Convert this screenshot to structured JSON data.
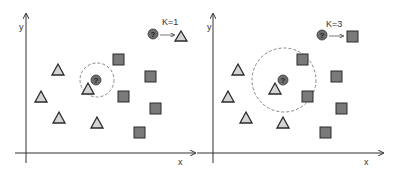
{
  "colors": {
    "axis": "#333333",
    "triangle_fill": "#d4d4d4",
    "triangle_stroke": "#2a2a2a",
    "square_fill": "#7a7a7a",
    "square_stroke": "#2a2a2a",
    "query_fill": "#6e6e6e",
    "dashed_circle": "#888888"
  },
  "panels": [
    {
      "id": "k1",
      "axis_labels": {
        "x": "x",
        "y": "y"
      },
      "k_label": "K=1",
      "query_symbol": "?",
      "result_class": "triangle",
      "neighborhood_radius": 17,
      "query_point": [
        97,
        80
      ],
      "triangles": [
        [
          58,
          70
        ],
        [
          41,
          97
        ],
        [
          59,
          118
        ],
        [
          97,
          123
        ],
        [
          88,
          89
        ]
      ],
      "squares": [
        [
          118,
          59
        ],
        [
          150,
          76
        ],
        [
          123,
          96
        ],
        [
          155,
          108
        ],
        [
          139,
          132
        ]
      ]
    },
    {
      "id": "k3",
      "axis_labels": {
        "x": "x",
        "y": "y"
      },
      "k_label": "K=3",
      "query_symbol": "?",
      "result_class": "square",
      "neighborhood_radius": 32,
      "query_point": [
        283,
        80
      ],
      "triangles": [
        [
          238,
          70
        ],
        [
          228,
          97
        ],
        [
          246,
          118
        ],
        [
          283,
          123
        ],
        [
          275,
          89
        ]
      ],
      "squares": [
        [
          302,
          59
        ],
        [
          336,
          76
        ],
        [
          307,
          96
        ],
        [
          341,
          108
        ],
        [
          325,
          132
        ]
      ]
    }
  ]
}
